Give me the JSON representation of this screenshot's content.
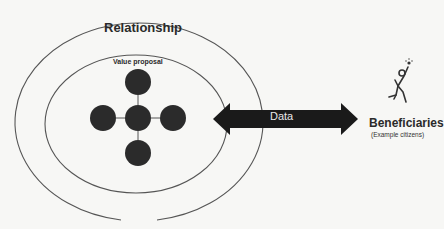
{
  "diagram": {
    "outer_ring": {
      "label": "Relationship"
    },
    "inner_ring": {
      "label": "Value proposal"
    },
    "nodes": [
      {
        "id": "top",
        "label": ""
      },
      {
        "id": "center",
        "label": ""
      },
      {
        "id": "left",
        "label": ""
      },
      {
        "id": "right",
        "label": ""
      },
      {
        "id": "bottom",
        "label": ""
      }
    ],
    "arrow": {
      "label": "Data",
      "direction": "bidirectional"
    },
    "beneficiaries": {
      "icon": "person-cheering-icon",
      "title": "Beneficiaries",
      "subtitle": "(Example citizens)"
    }
  },
  "colors": {
    "background": "#f7f7f5",
    "line": "#555555",
    "node_fill": "#2b2b2b",
    "arrow_fill": "#1a1a1a",
    "text": "#2a2a2a"
  }
}
